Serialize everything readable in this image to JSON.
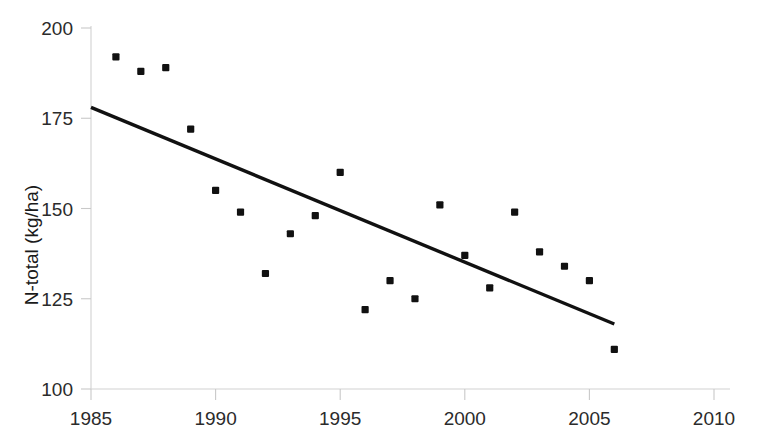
{
  "chart_data": {
    "type": "scatter",
    "title": "",
    "subtitle": "",
    "xlabel": "",
    "ylabel": "N-total (kg/ha)",
    "xlim": [
      1985,
      2010
    ],
    "ylim": [
      100,
      200
    ],
    "xticks": [
      1985,
      1990,
      1995,
      2000,
      2005,
      2010
    ],
    "yticks": [
      100,
      125,
      150,
      175,
      200
    ],
    "xtick_labels": [
      "1985",
      "1990",
      "1995",
      "2000",
      "2005",
      "2010"
    ],
    "ytick_labels": [
      "100",
      "125",
      "150",
      "175",
      "200"
    ],
    "grid": false,
    "legend": null,
    "legend_position": "none",
    "marker": "square",
    "marker_color": "#111111",
    "series": [
      {
        "name": "N-total",
        "x": [
          1986,
          1987,
          1988,
          1989,
          1990,
          1991,
          1992,
          1993,
          1994,
          1995,
          1996,
          1997,
          1998,
          1999,
          2000,
          2001,
          2002,
          2003,
          2004,
          2005,
          2006
        ],
        "values": [
          192,
          188,
          189,
          172,
          155,
          149,
          132,
          143,
          148,
          160,
          122,
          130,
          125,
          151,
          137,
          128,
          149,
          138,
          134,
          130,
          111
        ]
      }
    ],
    "trend_line": {
      "name": "linear trend",
      "x": [
        1985,
        2006
      ],
      "y": [
        178,
        118
      ],
      "color": "#111111"
    },
    "annotations": []
  },
  "axes": {
    "y_axis_title": "N-total (kg/ha)"
  }
}
